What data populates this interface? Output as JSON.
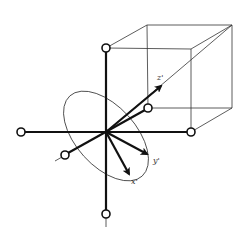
{
  "diagram": {
    "colors": {
      "stroke": "#111111",
      "thin": "#333333",
      "background": "#ffffff"
    },
    "labels": {
      "z_prime": "z'",
      "y_prime": "y'",
      "x_prime": "x'"
    },
    "origin": [
      106,
      132
    ],
    "axes_endpoints": {
      "up": [
        106,
        48
      ],
      "down": [
        106,
        214
      ],
      "left": [
        21,
        132
      ],
      "right": [
        191,
        132
      ],
      "front": [
        65,
        155
      ],
      "back": [
        148,
        108
      ]
    },
    "cube": {
      "front_top_left": [
        106,
        48
      ],
      "front_top_right": [
        191,
        49
      ],
      "back_top_left": [
        147,
        25
      ],
      "back_top_right": [
        232,
        25
      ],
      "back_bottom_left": [
        148,
        108
      ],
      "back_bottom_right": [
        232,
        108
      ],
      "front_bottom_right": [
        191,
        132
      ]
    },
    "rotated_axes": {
      "z_prime_tip": [
        162,
        85
      ],
      "y_prime_tip": [
        148,
        155
      ],
      "x_prime_tip": [
        130,
        175
      ]
    }
  }
}
